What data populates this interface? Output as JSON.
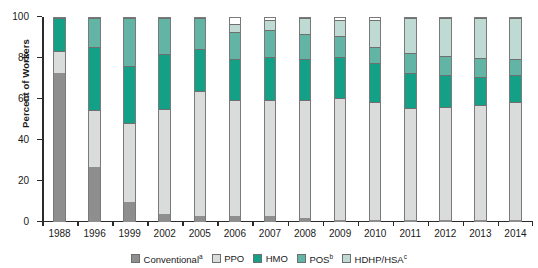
{
  "chart_data": {
    "type": "bar",
    "stacked": true,
    "title": "",
    "xlabel": "",
    "ylabel": "Percent of Workers",
    "ylim": [
      0,
      100
    ],
    "yticks": [
      0,
      20,
      40,
      60,
      80,
      100
    ],
    "grid": false,
    "legend_position": "bottom",
    "categories": [
      "1988",
      "1996",
      "1999",
      "2002",
      "2005",
      "2006",
      "2007",
      "2008",
      "2009",
      "2010",
      "2011",
      "2012",
      "2013",
      "2014"
    ],
    "series": [
      {
        "name": "Conventional",
        "footnote": "a",
        "color": "#8e8e8e",
        "values": [
          73,
          27,
          10,
          4,
          3,
          3,
          3,
          2,
          1,
          1,
          1,
          1,
          1,
          1
        ]
      },
      {
        "name": "PPO",
        "footnote": "",
        "color": "#d9dcda",
        "values": [
          11,
          28,
          39,
          52,
          61,
          57,
          57,
          58,
          60,
          58,
          55,
          56,
          57,
          58
        ]
      },
      {
        "name": "HMO",
        "footnote": "",
        "color": "#14a086",
        "values": [
          16,
          31,
          28,
          27,
          21,
          20,
          21,
          20,
          20,
          19,
          17,
          16,
          14,
          13
        ]
      },
      {
        "name": "POS",
        "footnote": "b",
        "color": "#62b5a5",
        "values": [
          0,
          14,
          24,
          18,
          15,
          13,
          13,
          12,
          10,
          8,
          10,
          9,
          9,
          8
        ]
      },
      {
        "name": "HDHP/HSA",
        "footnote": "c",
        "color": "#bfd9d3",
        "values": [
          0,
          0,
          0,
          0,
          0,
          4,
          5,
          8,
          8,
          13,
          17,
          19,
          20,
          20
        ]
      }
    ]
  },
  "legend": {
    "items": [
      {
        "label": "Conventional",
        "footnote": "a"
      },
      {
        "label": "PPO",
        "footnote": ""
      },
      {
        "label": "HMO",
        "footnote": ""
      },
      {
        "label": "POS",
        "footnote": "b"
      },
      {
        "label": "HDHP/HSA",
        "footnote": "c"
      }
    ]
  }
}
